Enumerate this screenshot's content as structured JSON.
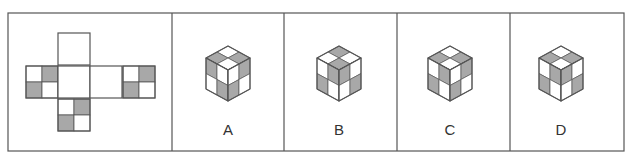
{
  "colors": {
    "gray": "#a8a8a8",
    "white": "#ffffff",
    "line": "#555555"
  },
  "frame": {
    "x": 8,
    "y": 13,
    "w": 616,
    "h": 138,
    "dividers": [
      172,
      284,
      397,
      510
    ]
  },
  "net": {
    "cell": 32,
    "faces": [
      {
        "name": "top",
        "x": 58,
        "y": 33,
        "quads": [
          "w",
          "w",
          "w",
          "w"
        ],
        "split": false
      },
      {
        "name": "left",
        "x": 26,
        "y": 66,
        "quads": [
          "w",
          "g",
          "g",
          "w"
        ],
        "split": true
      },
      {
        "name": "front",
        "x": 58,
        "y": 66,
        "quads": [
          "w",
          "w",
          "w",
          "w"
        ],
        "split": false
      },
      {
        "name": "right",
        "x": 90,
        "y": 66,
        "quads": [
          "w",
          "w",
          "w",
          "w"
        ],
        "split": false
      },
      {
        "name": "back",
        "x": 123,
        "y": 66,
        "quads": [
          "w",
          "g",
          "g",
          "w"
        ],
        "split": true
      },
      {
        "name": "bottom",
        "x": 58,
        "y": 99,
        "quads": [
          "w",
          "g",
          "g",
          "w"
        ],
        "split": true
      }
    ]
  },
  "options": [
    {
      "label": "A",
      "cx": 228,
      "labelX": 208,
      "top": [
        "w",
        "g",
        "g",
        "w"
      ],
      "left": [
        "g",
        "w",
        "w",
        "g"
      ],
      "right": [
        "w",
        "g",
        "g",
        "w"
      ]
    },
    {
      "label": "B",
      "cx": 339,
      "labelX": 319,
      "top": [
        "g",
        "w",
        "w",
        "g"
      ],
      "left": [
        "w",
        "g",
        "g",
        "w"
      ],
      "right": [
        "g",
        "w",
        "w",
        "g"
      ]
    },
    {
      "label": "C",
      "cx": 450,
      "labelX": 430,
      "top": [
        "w",
        "g",
        "g",
        "w"
      ],
      "left": [
        "w",
        "g",
        "g",
        "w"
      ],
      "right": [
        "w",
        "g",
        "g",
        "w"
      ]
    },
    {
      "label": "D",
      "cx": 561,
      "labelX": 541,
      "top": [
        "w",
        "g",
        "g",
        "w"
      ],
      "left": [
        "w",
        "g",
        "g",
        "w"
      ],
      "right": [
        "g",
        "w",
        "w",
        "g"
      ]
    }
  ]
}
